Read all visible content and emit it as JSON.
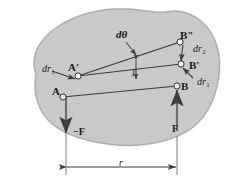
{
  "figure": {
    "body_shape_label": "rigid-body-blob",
    "colors": {
      "body_fill": "#c9c9c9",
      "body_stroke": "#9a9a9a",
      "line": "#3c3c3c",
      "node_fill": "#f2f2f2",
      "node_stroke": "#2e2e2e",
      "text": "#1a1a1a",
      "background": "#ffffff"
    },
    "points": [
      {
        "name": "A",
        "label": "A",
        "prime": "",
        "x": 63,
        "y": 97
      },
      {
        "name": "Aprime",
        "label": "A",
        "prime": "'",
        "x": 78,
        "y": 76
      },
      {
        "name": "B",
        "label": "B",
        "prime": "",
        "x": 177,
        "y": 86
      },
      {
        "name": "Bprime",
        "label": "B",
        "prime": "'",
        "x": 181,
        "y": 64
      },
      {
        "name": "Bpp",
        "label": "B",
        "prime": "\"",
        "x": 180,
        "y": 42
      }
    ],
    "vectors": [
      {
        "name": "dr1-at-A",
        "symbol": "dr",
        "subscript": "1"
      },
      {
        "name": "dr2-at-B",
        "symbol": "dr",
        "subscript": "2"
      },
      {
        "name": "dr1-at-B",
        "symbol": "dr",
        "subscript": "1"
      }
    ],
    "angle": {
      "name": "d-theta",
      "symbol": "dθ"
    },
    "length": {
      "name": "length-l",
      "symbol": "l"
    },
    "forces": [
      {
        "name": "force-negative-F",
        "label": "−F",
        "direction": "down",
        "applied_at": "A"
      },
      {
        "name": "force-positive-F",
        "label": "F",
        "direction": "up",
        "applied_at": "B"
      }
    ],
    "dimension": {
      "name": "separation-r",
      "label": "r",
      "between": [
        "A",
        "B"
      ]
    }
  }
}
